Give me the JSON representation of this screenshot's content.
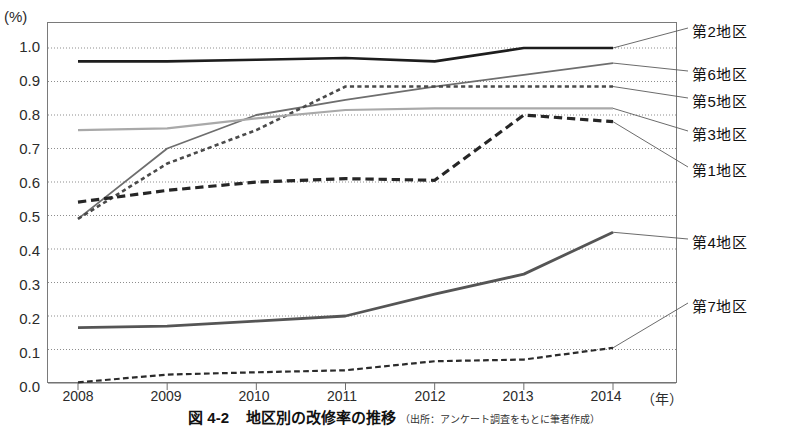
{
  "axis": {
    "y_unit": "(%)",
    "y_ticks": [
      "1.0",
      "0.9",
      "0.8",
      "0.7",
      "0.6",
      "0.5",
      "0.4",
      "0.3",
      "0.2",
      "0.1",
      "0.0"
    ],
    "x_ticks": [
      "2008",
      "2009",
      "2010",
      "2011",
      "2012",
      "2013",
      "2014"
    ],
    "x_unit": "（年）"
  },
  "legend": [
    {
      "label": "第2地区"
    },
    {
      "label": "第6地区"
    },
    {
      "label": "第5地区"
    },
    {
      "label": "第3地区"
    },
    {
      "label": "第1地区"
    },
    {
      "label": "第4地区"
    },
    {
      "label": "第7地区"
    }
  ],
  "caption": {
    "figure_no": "図 4-2",
    "title": "地区別の改修率の推移",
    "source": "（出所：アンケート調査をもとに筆者作成）"
  },
  "chart_data": {
    "type": "line",
    "title": "地区別の改修率の推移",
    "xlabel": "（年）",
    "ylabel": "(%)",
    "x": [
      2008,
      2009,
      2010,
      2011,
      2012,
      2013,
      2014
    ],
    "ylim": [
      0.0,
      1.05
    ],
    "xlim": [
      2008,
      2014
    ],
    "grid": true,
    "legend_position": "right-outside",
    "series": [
      {
        "name": "第2地区",
        "style": "solid",
        "color": "#1d1d1d",
        "width": 2.6,
        "values": [
          0.96,
          0.96,
          0.965,
          0.97,
          0.96,
          1.0,
          1.0
        ]
      },
      {
        "name": "第6地区",
        "style": "solid",
        "color": "#6e6e6e",
        "width": 1.8,
        "values": [
          0.49,
          0.7,
          0.8,
          0.845,
          0.885,
          0.92,
          0.955
        ]
      },
      {
        "name": "第5地区",
        "style": "dotted",
        "color": "#4a4a4a",
        "width": 2.6,
        "values": [
          0.49,
          0.655,
          0.755,
          0.885,
          0.885,
          0.885,
          0.885
        ]
      },
      {
        "name": "第3地区",
        "style": "solid",
        "color": "#a9a9a9",
        "width": 2.2,
        "values": [
          0.755,
          0.76,
          0.79,
          0.815,
          0.82,
          0.82,
          0.82
        ]
      },
      {
        "name": "第1地区",
        "style": "dashed",
        "color": "#262626",
        "width": 3.2,
        "values": [
          0.54,
          0.575,
          0.6,
          0.61,
          0.605,
          0.8,
          0.78
        ]
      },
      {
        "name": "第4地区",
        "style": "solid",
        "color": "#555555",
        "width": 2.8,
        "values": [
          0.165,
          0.17,
          0.185,
          0.2,
          0.265,
          0.325,
          0.45
        ]
      },
      {
        "name": "第7地区",
        "style": "dashed",
        "color": "#2b2b2b",
        "width": 2.2,
        "values": [
          0.002,
          0.025,
          0.032,
          0.038,
          0.065,
          0.07,
          0.105
        ]
      }
    ]
  }
}
